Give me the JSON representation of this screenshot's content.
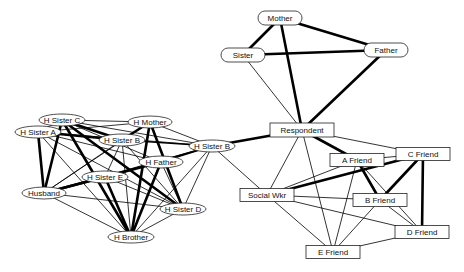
{
  "chart_data": {
    "type": "network",
    "title": "",
    "nodes": [
      {
        "id": "mother",
        "label": "Mother",
        "shape": "round",
        "x": 280,
        "y": 18,
        "w": 44,
        "h": 14
      },
      {
        "id": "sister",
        "label": "Sister",
        "shape": "round",
        "x": 243,
        "y": 55,
        "w": 44,
        "h": 14
      },
      {
        "id": "father",
        "label": "Father",
        "shape": "round",
        "x": 386,
        "y": 50,
        "w": 44,
        "h": 14
      },
      {
        "id": "respondent",
        "label": "Respondent",
        "shape": "rect",
        "x": 302,
        "y": 130,
        "w": 64,
        "h": 14
      },
      {
        "id": "afriend",
        "label": "A Friend",
        "shape": "rect",
        "x": 357,
        "y": 160,
        "w": 54,
        "h": 13
      },
      {
        "id": "cfriend",
        "label": "C Friend",
        "shape": "rect",
        "x": 423,
        "y": 154,
        "w": 54,
        "h": 13
      },
      {
        "id": "socialwkr",
        "label": "Social Wkr",
        "shape": "rect",
        "x": 267,
        "y": 195,
        "w": 54,
        "h": 13
      },
      {
        "id": "bfriend",
        "label": "B Friend",
        "shape": "rect",
        "x": 380,
        "y": 200,
        "w": 54,
        "h": 13
      },
      {
        "id": "dfriend",
        "label": "D Friend",
        "shape": "rect",
        "x": 422,
        "y": 232,
        "w": 54,
        "h": 13
      },
      {
        "id": "efriend",
        "label": "E Friend",
        "shape": "rect",
        "x": 333,
        "y": 252,
        "w": 54,
        "h": 13
      },
      {
        "id": "hsisterc",
        "label": "H Sister C",
        "shape": "ellipse",
        "x": 62,
        "y": 120,
        "w": 46,
        "h": 12
      },
      {
        "id": "hmother",
        "label": "H Mother",
        "shape": "ellipse",
        "x": 150,
        "y": 122,
        "w": 44,
        "h": 12
      },
      {
        "id": "hsistera",
        "label": "H Sister A",
        "shape": "ellipse",
        "x": 38,
        "y": 132,
        "w": 46,
        "h": 12
      },
      {
        "id": "hsisterb1",
        "label": "H Sister B",
        "shape": "ellipse",
        "x": 122,
        "y": 140,
        "w": 46,
        "h": 12
      },
      {
        "id": "hsisterb2",
        "label": "H Sister B",
        "shape": "ellipse",
        "x": 212,
        "y": 146,
        "w": 46,
        "h": 12
      },
      {
        "id": "hfather",
        "label": "H Father",
        "shape": "ellipse",
        "x": 161,
        "y": 162,
        "w": 44,
        "h": 12
      },
      {
        "id": "hsistere",
        "label": "H Sister E",
        "shape": "ellipse",
        "x": 105,
        "y": 177,
        "w": 46,
        "h": 12
      },
      {
        "id": "husband",
        "label": "Husband",
        "shape": "ellipse",
        "x": 44,
        "y": 193,
        "w": 44,
        "h": 12
      },
      {
        "id": "hsisterd",
        "label": "H Sister D",
        "shape": "ellipse",
        "x": 183,
        "y": 209,
        "w": 46,
        "h": 12
      },
      {
        "id": "hbrother",
        "label": "H Brother",
        "shape": "ellipse",
        "x": 131,
        "y": 237,
        "w": 46,
        "h": 12
      }
    ],
    "edges": [
      {
        "from": "mother",
        "to": "sister",
        "weight": 3
      },
      {
        "from": "mother",
        "to": "father",
        "weight": 3
      },
      {
        "from": "mother",
        "to": "respondent",
        "weight": 3
      },
      {
        "from": "sister",
        "to": "father",
        "weight": 3
      },
      {
        "from": "sister",
        "to": "respondent",
        "weight": 1
      },
      {
        "from": "father",
        "to": "respondent",
        "weight": 3
      },
      {
        "from": "respondent",
        "to": "hsisterb2",
        "weight": 3
      },
      {
        "from": "respondent",
        "to": "afriend",
        "weight": 3
      },
      {
        "from": "respondent",
        "to": "cfriend",
        "weight": 1
      },
      {
        "from": "respondent",
        "to": "socialwkr",
        "weight": 1
      },
      {
        "from": "respondent",
        "to": "efriend",
        "weight": 1
      },
      {
        "from": "afriend",
        "to": "bfriend",
        "weight": 3
      },
      {
        "from": "afriend",
        "to": "socialwkr",
        "weight": 1
      },
      {
        "from": "afriend",
        "to": "dfriend",
        "weight": 1
      },
      {
        "from": "afriend",
        "to": "efriend",
        "weight": 1
      },
      {
        "from": "afriend",
        "to": "cfriend",
        "weight": 1
      },
      {
        "from": "cfriend",
        "to": "socialwkr",
        "weight": 3
      },
      {
        "from": "cfriend",
        "to": "bfriend",
        "weight": 3
      },
      {
        "from": "cfriend",
        "to": "dfriend",
        "weight": 3
      },
      {
        "from": "socialwkr",
        "to": "bfriend",
        "weight": 1
      },
      {
        "from": "socialwkr",
        "to": "dfriend",
        "weight": 1
      },
      {
        "from": "socialwkr",
        "to": "efriend",
        "weight": 1
      },
      {
        "from": "socialwkr",
        "to": "hsisterb2",
        "weight": 1
      },
      {
        "from": "bfriend",
        "to": "efriend",
        "weight": 1
      },
      {
        "from": "bfriend",
        "to": "dfriend",
        "weight": 1
      },
      {
        "from": "dfriend",
        "to": "efriend",
        "weight": 1
      },
      {
        "from": "hsisterc",
        "to": "hmother",
        "weight": 1
      },
      {
        "from": "hsisterc",
        "to": "hsistera",
        "weight": 1
      },
      {
        "from": "hsisterc",
        "to": "husband",
        "weight": 3
      },
      {
        "from": "hsisterc",
        "to": "hsisterb1",
        "weight": 3
      },
      {
        "from": "hsisterc",
        "to": "hbrother",
        "weight": 3
      },
      {
        "from": "hsisterc",
        "to": "hsisterd",
        "weight": 3
      },
      {
        "from": "hsisterc",
        "to": "hsisterb2",
        "weight": 1
      },
      {
        "from": "hsisterc",
        "to": "hfather",
        "weight": 1
      },
      {
        "from": "hmother",
        "to": "hsistera",
        "weight": 1
      },
      {
        "from": "hmother",
        "to": "hsisterb1",
        "weight": 3
      },
      {
        "from": "hmother",
        "to": "hbrother",
        "weight": 3
      },
      {
        "from": "hmother",
        "to": "hsisterd",
        "weight": 3
      },
      {
        "from": "hmother",
        "to": "hsisterb2",
        "weight": 1
      },
      {
        "from": "hmother",
        "to": "husband",
        "weight": 1
      },
      {
        "from": "hsistera",
        "to": "hsisterb1",
        "weight": 3
      },
      {
        "from": "hsistera",
        "to": "husband",
        "weight": 3
      },
      {
        "from": "hsistera",
        "to": "hfather",
        "weight": 1
      },
      {
        "from": "hsistera",
        "to": "hbrother",
        "weight": 1
      },
      {
        "from": "hsistera",
        "to": "hsisterd",
        "weight": 1
      },
      {
        "from": "hsistera",
        "to": "hsisterb2",
        "weight": 1
      },
      {
        "from": "hsisterb1",
        "to": "hsisterb2",
        "weight": 2
      },
      {
        "from": "hsisterb1",
        "to": "hbrother",
        "weight": 1
      },
      {
        "from": "hsisterb1",
        "to": "hsistere",
        "weight": 1
      },
      {
        "from": "hsisterb1",
        "to": "husband",
        "weight": 1
      },
      {
        "from": "hsisterb1",
        "to": "hsisterd",
        "weight": 1
      },
      {
        "from": "hsisterb2",
        "to": "hfather",
        "weight": 2
      },
      {
        "from": "hsisterb2",
        "to": "hsistere",
        "weight": 2
      },
      {
        "from": "hsisterb2",
        "to": "hsisterd",
        "weight": 1
      },
      {
        "from": "hsisterb2",
        "to": "hbrother",
        "weight": 1
      },
      {
        "from": "hsisterb2",
        "to": "husband",
        "weight": 1
      },
      {
        "from": "hfather",
        "to": "husband",
        "weight": 3
      },
      {
        "from": "hfather",
        "to": "hbrother",
        "weight": 3
      },
      {
        "from": "hfather",
        "to": "hsistere",
        "weight": 1
      },
      {
        "from": "hfather",
        "to": "hsisterd",
        "weight": 1
      },
      {
        "from": "hsistere",
        "to": "husband",
        "weight": 3
      },
      {
        "from": "hsistere",
        "to": "hbrother",
        "weight": 3
      },
      {
        "from": "hsistere",
        "to": "hsisterd",
        "weight": 1
      },
      {
        "from": "husband",
        "to": "hbrother",
        "weight": 1
      },
      {
        "from": "husband",
        "to": "hsisterd",
        "weight": 1
      },
      {
        "from": "hsisterd",
        "to": "hbrother",
        "weight": 1
      }
    ]
  }
}
